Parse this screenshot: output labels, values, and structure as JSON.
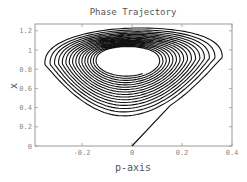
{
  "chart_data": {
    "type": "line",
    "title": "Phase Trajectory",
    "xlabel": "p-axis",
    "ylabel": "x",
    "xlim": [
      -0.39,
      0.4
    ],
    "ylim": [
      0,
      1.26
    ],
    "xticks": [
      -0.2,
      0,
      0.2,
      0.4
    ],
    "xtick_labels": [
      "-0.2",
      "0",
      "0.2",
      "0.4"
    ],
    "yticks": [
      0,
      0.2,
      0.4,
      0.6,
      0.8,
      1,
      1.2
    ],
    "ytick_labels": [
      "0",
      "0.2",
      "0.4",
      "0.6",
      "0.8",
      "1",
      "1.2"
    ],
    "grid": false,
    "legend": null,
    "series": [
      {
        "name": "trajectory",
        "color": "#111111",
        "start_point": [
          0,
          0
        ],
        "join_point": [
          0.22,
          0.27
        ],
        "description": "Straight segment from origin joining an inward-converging spiral around center (-0.02, 0.88)",
        "spiral": {
          "center": [
            -0.02,
            0.88
          ],
          "outer_extent": {
            "p_min": -0.37,
            "p_max": 0.37,
            "x_min": 0.26,
            "x_max": 1.24
          },
          "inner_extent": {
            "p_min": -0.14,
            "p_max": 0.1,
            "x_min": 0.73,
            "x_max": 1.03
          },
          "loops": 16
        }
      }
    ]
  }
}
